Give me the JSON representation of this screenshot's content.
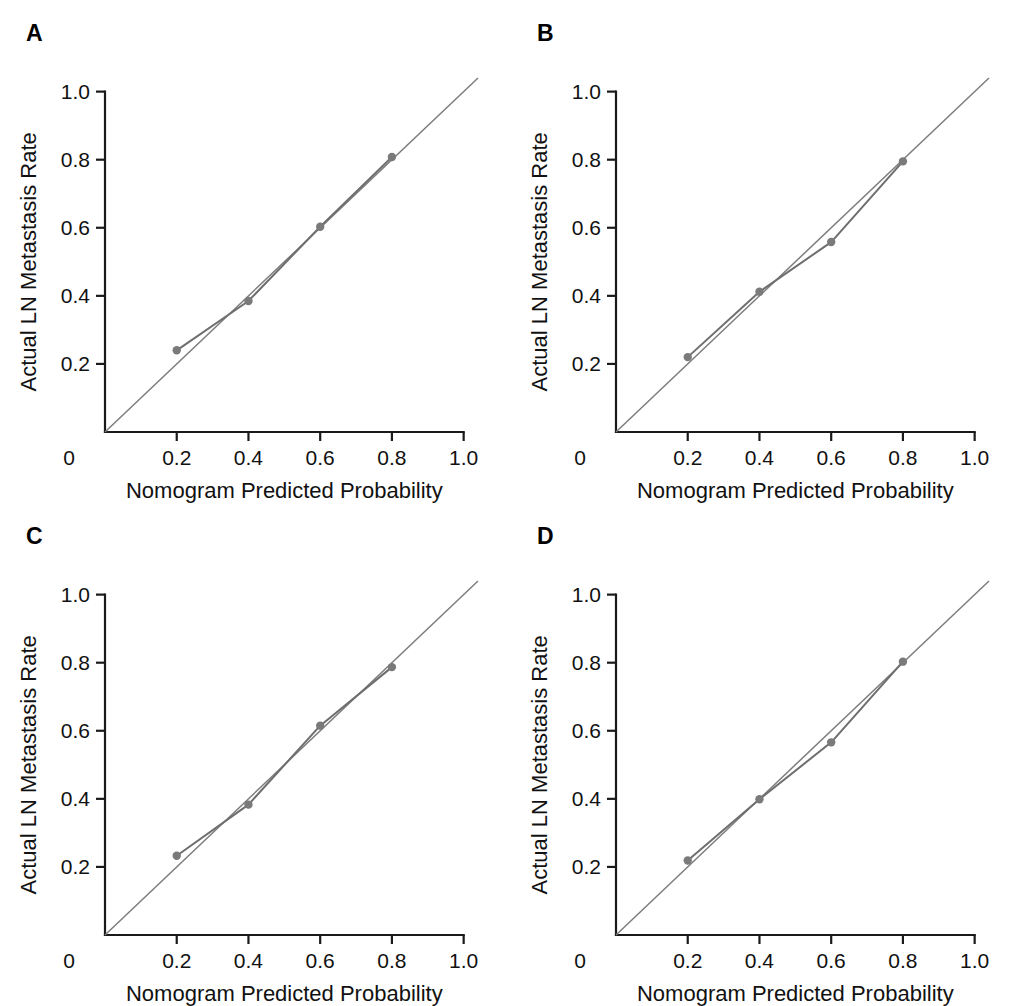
{
  "figure": {
    "panel_letters": [
      "A",
      "B",
      "C",
      "D"
    ],
    "axis": {
      "xlabel": "Nomogram Predicted Probability",
      "ylabel": "Actual LN Metastasis Rate",
      "x_ticks": [
        "0",
        "0.2",
        "0.4",
        "0.6",
        "0.8",
        "1.0"
      ],
      "y_ticks": [
        "0.2",
        "0.4",
        "0.6",
        "0.8",
        "1.0"
      ]
    },
    "colors": {
      "axis": "#1a1a1a",
      "reference_line": "#7d7d7d",
      "calibration_line": "#6e6e6e",
      "marker": "#7a7a7a",
      "background": "#ffffff"
    }
  },
  "chart_data": [
    {
      "type": "line",
      "panel": "A",
      "title": "A",
      "xlabel": "Nomogram Predicted Probability",
      "ylabel": "Actual LN Metastasis Rate",
      "xlim": [
        0,
        1.04
      ],
      "ylim": [
        0,
        1.04
      ],
      "x_ticks": [
        0,
        0.2,
        0.4,
        0.6,
        0.8,
        1.0
      ],
      "y_ticks": [
        0.2,
        0.4,
        0.6,
        0.8,
        1.0
      ],
      "grid": false,
      "legend": "none",
      "series": [
        {
          "name": "Ideal",
          "style": "reference-diagonal",
          "x": [
            0,
            1.04
          ],
          "values": [
            0,
            1.04
          ]
        },
        {
          "name": "Apparent",
          "style": "line-with-markers",
          "x": [
            0.2,
            0.4,
            0.6,
            0.8
          ],
          "values": [
            0.24,
            0.385,
            0.603,
            0.808
          ]
        }
      ]
    },
    {
      "type": "line",
      "panel": "B",
      "title": "B",
      "xlabel": "Nomogram Predicted Probability",
      "ylabel": "Actual LN Metastasis Rate",
      "xlim": [
        0,
        1.04
      ],
      "ylim": [
        0,
        1.04
      ],
      "x_ticks": [
        0,
        0.2,
        0.4,
        0.6,
        0.8,
        1.0
      ],
      "y_ticks": [
        0.2,
        0.4,
        0.6,
        0.8,
        1.0
      ],
      "grid": false,
      "legend": "none",
      "series": [
        {
          "name": "Ideal",
          "style": "reference-diagonal",
          "x": [
            0,
            1.04
          ],
          "values": [
            0,
            1.04
          ]
        },
        {
          "name": "Apparent",
          "style": "line-with-markers",
          "x": [
            0.2,
            0.4,
            0.6,
            0.8
          ],
          "values": [
            0.22,
            0.412,
            0.558,
            0.795
          ]
        }
      ]
    },
    {
      "type": "line",
      "panel": "C",
      "title": "C",
      "xlabel": "Nomogram Predicted Probability",
      "ylabel": "Actual LN Metastasis Rate",
      "xlim": [
        0,
        1.04
      ],
      "ylim": [
        0,
        1.04
      ],
      "x_ticks": [
        0,
        0.2,
        0.4,
        0.6,
        0.8,
        1.0
      ],
      "y_ticks": [
        0.2,
        0.4,
        0.6,
        0.8,
        1.0
      ],
      "grid": false,
      "legend": "none",
      "series": [
        {
          "name": "Ideal",
          "style": "reference-diagonal",
          "x": [
            0,
            1.04
          ],
          "values": [
            0,
            1.04
          ]
        },
        {
          "name": "Apparent",
          "style": "line-with-markers",
          "x": [
            0.2,
            0.4,
            0.6,
            0.8
          ],
          "values": [
            0.233,
            0.383,
            0.615,
            0.787
          ]
        }
      ]
    },
    {
      "type": "line",
      "panel": "D",
      "title": "D",
      "xlabel": "Nomogram Predicted Probability",
      "ylabel": "Actual LN Metastasis Rate",
      "xlim": [
        0,
        1.04
      ],
      "ylim": [
        0,
        1.04
      ],
      "x_ticks": [
        0,
        0.2,
        0.4,
        0.6,
        0.8,
        1.0
      ],
      "y_ticks": [
        0.2,
        0.4,
        0.6,
        0.8,
        1.0
      ],
      "grid": false,
      "legend": "none",
      "series": [
        {
          "name": "Ideal",
          "style": "reference-diagonal",
          "x": [
            0,
            1.04
          ],
          "values": [
            0,
            1.04
          ]
        },
        {
          "name": "Apparent",
          "style": "line-with-markers",
          "x": [
            0.2,
            0.4,
            0.6,
            0.8
          ],
          "values": [
            0.219,
            0.399,
            0.566,
            0.803
          ]
        }
      ]
    }
  ]
}
